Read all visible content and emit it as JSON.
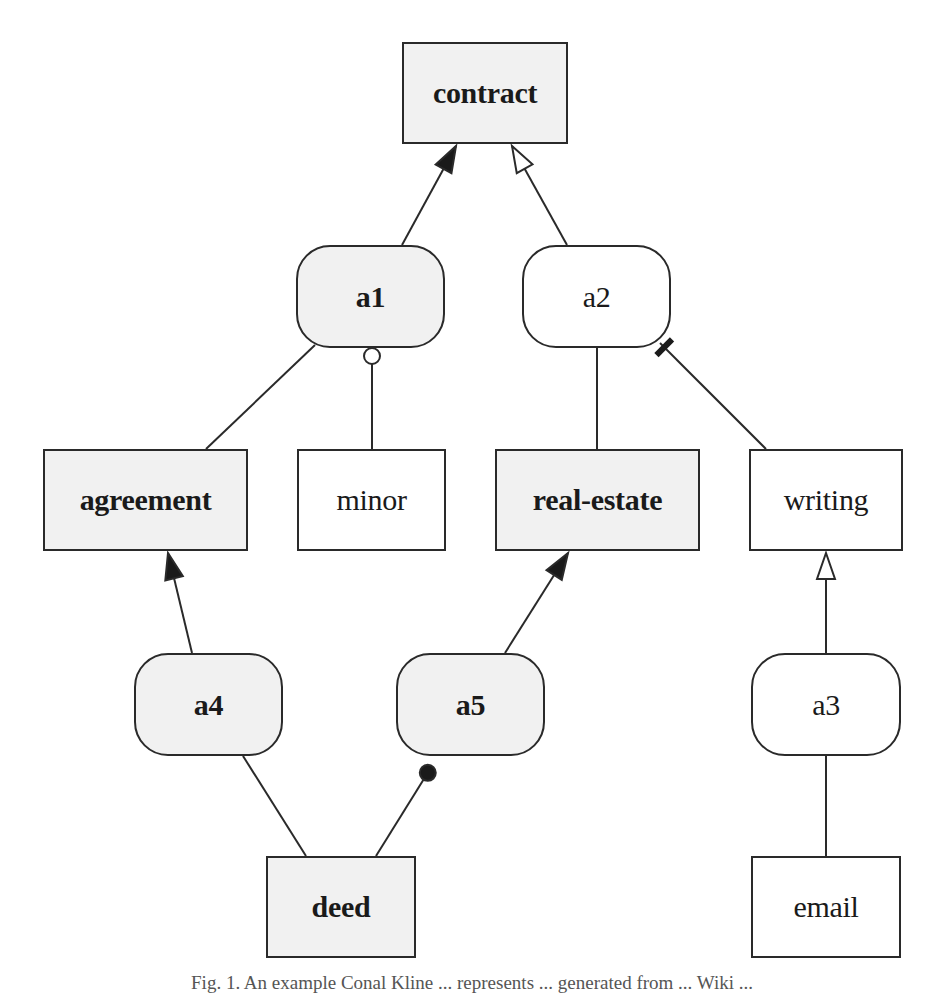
{
  "diagram": {
    "nodes": [
      {
        "id": "contract",
        "label": "contract",
        "shape": "rect",
        "fill": "gray",
        "bold": true,
        "x": 402,
        "y": 42,
        "w": 166,
        "h": 102
      },
      {
        "id": "a1",
        "label": "a1",
        "shape": "round",
        "fill": "gray",
        "bold": true,
        "x": 296,
        "y": 245,
        "w": 149,
        "h": 103
      },
      {
        "id": "a2",
        "label": "a2",
        "shape": "round",
        "fill": "white",
        "bold": false,
        "x": 522,
        "y": 245,
        "w": 149,
        "h": 103
      },
      {
        "id": "agreement",
        "label": "agreement",
        "shape": "rect",
        "fill": "gray",
        "bold": true,
        "x": 43,
        "y": 449,
        "w": 205,
        "h": 102
      },
      {
        "id": "minor",
        "label": "minor",
        "shape": "rect",
        "fill": "white",
        "bold": false,
        "x": 297,
        "y": 449,
        "w": 149,
        "h": 102
      },
      {
        "id": "real-estate",
        "label": "real-estate",
        "shape": "rect",
        "fill": "gray",
        "bold": true,
        "x": 495,
        "y": 449,
        "w": 205,
        "h": 102
      },
      {
        "id": "writing",
        "label": "writing",
        "shape": "rect",
        "fill": "white",
        "bold": false,
        "x": 749,
        "y": 449,
        "w": 154,
        "h": 102
      },
      {
        "id": "a4",
        "label": "a4",
        "shape": "round",
        "fill": "gray",
        "bold": true,
        "x": 134,
        "y": 653,
        "w": 149,
        "h": 103
      },
      {
        "id": "a5",
        "label": "a5",
        "shape": "round",
        "fill": "gray",
        "bold": true,
        "x": 396,
        "y": 653,
        "w": 149,
        "h": 103
      },
      {
        "id": "a3",
        "label": "a3",
        "shape": "round",
        "fill": "white",
        "bold": false,
        "x": 751,
        "y": 653,
        "w": 150,
        "h": 103
      },
      {
        "id": "deed",
        "label": "deed",
        "shape": "rect",
        "fill": "gray",
        "bold": true,
        "x": 266,
        "y": 856,
        "w": 150,
        "h": 102
      },
      {
        "id": "email",
        "label": "email",
        "shape": "rect",
        "fill": "white",
        "bold": false,
        "x": 751,
        "y": 856,
        "w": 150,
        "h": 102
      }
    ],
    "edges": [
      {
        "from": "a1",
        "to": "contract",
        "x1": 402,
        "y1": 245,
        "x2": 456,
        "y2": 146,
        "end": "filled-arrow"
      },
      {
        "from": "a2",
        "to": "contract",
        "x1": 567,
        "y1": 245,
        "x2": 512,
        "y2": 146,
        "end": "hollow-arrow"
      },
      {
        "from": "agreement",
        "to": "a1",
        "x1": 206,
        "y1": 449,
        "x2": 315,
        "y2": 345,
        "end": "none"
      },
      {
        "from": "minor",
        "to": "a1",
        "x1": 372,
        "y1": 449,
        "x2": 372,
        "y2": 348,
        "end": "hollow-circle"
      },
      {
        "from": "real-estate",
        "to": "a2",
        "x1": 597,
        "y1": 449,
        "x2": 597,
        "y2": 348,
        "end": "none"
      },
      {
        "from": "writing",
        "to": "a2",
        "x1": 766,
        "y1": 449,
        "x2": 660,
        "y2": 343,
        "end": "bar"
      },
      {
        "from": "a4",
        "to": "agreement",
        "x1": 192,
        "y1": 653,
        "x2": 168,
        "y2": 553,
        "end": "filled-arrow"
      },
      {
        "from": "a5",
        "to": "real-estate",
        "x1": 505,
        "y1": 653,
        "x2": 568,
        "y2": 553,
        "end": "filled-arrow"
      },
      {
        "from": "a3",
        "to": "writing",
        "x1": 826,
        "y1": 653,
        "x2": 826,
        "y2": 553,
        "end": "hollow-arrow"
      },
      {
        "from": "deed",
        "to": "a4",
        "x1": 306,
        "y1": 856,
        "x2": 243,
        "y2": 756,
        "end": "none"
      },
      {
        "from": "deed",
        "to": "a5",
        "x1": 376,
        "y1": 856,
        "x2": 432,
        "y2": 766,
        "end": "filled-circle"
      },
      {
        "from": "email",
        "to": "a3",
        "x1": 826,
        "y1": 856,
        "x2": 826,
        "y2": 756,
        "end": "none"
      }
    ]
  },
  "caption": {
    "text": "Fig. 1. An example Conal Kline ... represents ... generated from ... Wiki ..."
  },
  "colors": {
    "stroke": "#2a2a2a",
    "gray_fill": "#f1f1f1",
    "white_fill": "#ffffff"
  }
}
